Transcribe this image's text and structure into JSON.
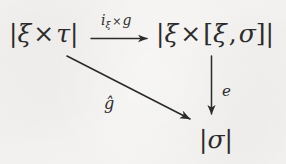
{
  "figure": {
    "kind": "commutative-diagram",
    "background_color": "#f4f3f1",
    "ink_color": "#2b2b2b"
  },
  "nodes": {
    "top_left": {
      "name": "xi-times-tau",
      "bar_open": "|",
      "xi": "ξ",
      "times": "×",
      "tau": "τ",
      "bar_close": "|",
      "plain_text": "|ξ × τ|"
    },
    "top_right": {
      "name": "xi-times-hom",
      "bar_open": "|",
      "xi": "ξ",
      "times": "×",
      "bracket_open": "[",
      "xi2": "ξ",
      "comma": ",",
      "sigma": "σ",
      "bracket_close": "]",
      "bar_close": "|",
      "plain_text": "|ξ × [ξ, σ]|"
    },
    "bottom_right": {
      "name": "sigma",
      "bar_open": "|",
      "sigma": "σ",
      "bar_close": "|",
      "plain_text": "|σ|"
    }
  },
  "arrows": {
    "horizontal": {
      "name": "arrow-top",
      "from": "top_left",
      "to": "top_right",
      "direction": "right",
      "label": {
        "i": "i",
        "subscript": "ξ",
        "times": "×",
        "g": "g",
        "plain_text": "iξ × g"
      }
    },
    "vertical": {
      "name": "arrow-right",
      "from": "top_right",
      "to": "bottom_right",
      "direction": "down",
      "label": {
        "text": "e",
        "plain_text": "e"
      }
    },
    "diagonal": {
      "name": "arrow-diagonal",
      "from": "top_left",
      "to": "bottom_right",
      "direction": "down-right",
      "label": {
        "text": "ĝ",
        "plain_text": "ĝ (g with hat)"
      }
    }
  }
}
